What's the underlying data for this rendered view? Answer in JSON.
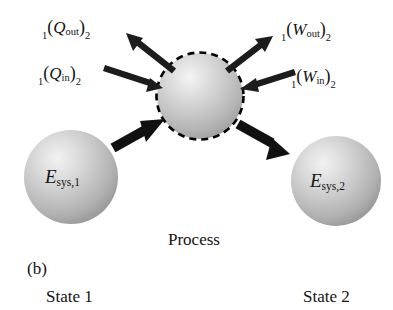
{
  "figure": {
    "panel_label": "(b)",
    "center_caption": "Process",
    "left_caption": "State 1",
    "right_caption": "State 2",
    "colors": {
      "sphere_highlight": "#efefef",
      "sphere_mid": "#c4c4c4",
      "sphere_edge": "#9a9a9a",
      "arrow": "#1a1a1a",
      "boundary_dash": "#000000",
      "background": "#ffffff",
      "text": "#141414"
    },
    "system_boundary": {
      "name": "system-boundary",
      "style": "dashed",
      "shape": "circle"
    },
    "spheres": [
      {
        "id": "state-1",
        "symbol": "E",
        "subscript": "sys,1",
        "text": "Esys,1"
      },
      {
        "id": "system",
        "symbol": "",
        "subscript": "",
        "text": ""
      },
      {
        "id": "state-2",
        "symbol": "E",
        "subscript": "sys,2",
        "text": "Esys,2"
      }
    ],
    "flows": [
      {
        "id": "q-out",
        "pre_subscript": "1",
        "symbol": "Q",
        "inner_subscript": "out",
        "post_subscript": "2",
        "text": "1(Qout)2",
        "direction": "out",
        "side": "upper-left",
        "quantity": "heat"
      },
      {
        "id": "q-in",
        "pre_subscript": "1",
        "symbol": "Q",
        "inner_subscript": "in",
        "post_subscript": "2",
        "text": "1(Qin)2",
        "direction": "in",
        "side": "left",
        "quantity": "heat"
      },
      {
        "id": "w-out",
        "pre_subscript": "1",
        "symbol": "W",
        "inner_subscript": "out",
        "post_subscript": "2",
        "text": "1(Wout)2",
        "direction": "out",
        "side": "upper-right",
        "quantity": "work"
      },
      {
        "id": "w-in",
        "pre_subscript": "1",
        "symbol": "W",
        "inner_subscript": "in",
        "post_subscript": "2",
        "text": "1(Win)2",
        "direction": "in",
        "side": "right",
        "quantity": "work"
      }
    ],
    "process_arrows": [
      {
        "id": "state1-to-system",
        "from": "state-1",
        "to": "system"
      },
      {
        "id": "system-to-state2",
        "from": "system",
        "to": "state-2"
      }
    ]
  }
}
